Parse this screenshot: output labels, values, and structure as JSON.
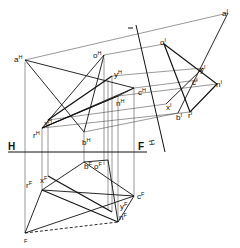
{
  "diagram": {
    "type": "descriptive-geometry-projection",
    "folding_lines": [
      {
        "name": "H-F",
        "labels": [
          "H",
          "F"
        ]
      },
      {
        "name": "H-I",
        "labels": [
          "H",
          "I"
        ]
      }
    ],
    "views": {
      "H": {
        "points": [
          "a",
          "o",
          "y",
          "c",
          "n",
          "x",
          "r",
          "b"
        ]
      },
      "F": {
        "points": [
          "b",
          "o",
          "x",
          "r",
          "c",
          "y",
          "n",
          "a"
        ]
      },
      "I": {
        "points": [
          "a",
          "o",
          "y",
          "c",
          "n",
          "x",
          "b",
          "r"
        ]
      }
    },
    "labels": {
      "aH": {
        "base": "a",
        "sup": "H"
      },
      "oH": {
        "base": "o",
        "sup": "H"
      },
      "yH": {
        "base": "y",
        "sup": "H"
      },
      "cH": {
        "base": "c",
        "sup": "H"
      },
      "nH": {
        "base": "n",
        "sup": "H"
      },
      "xH": {
        "base": "x",
        "sup": "H"
      },
      "rH": {
        "base": "r",
        "sup": "H"
      },
      "bH": {
        "base": "b",
        "sup": "H"
      },
      "bF": {
        "base": "b",
        "sup": "F"
      },
      "oF": {
        "base": "o",
        "sup": "F"
      },
      "xF": {
        "base": "x",
        "sup": "F"
      },
      "rF": {
        "base": "r",
        "sup": "F"
      },
      "cF": {
        "base": "c",
        "sup": "F"
      },
      "yF": {
        "base": "y",
        "sup": "F"
      },
      "nF": {
        "base": "n",
        "sup": "F"
      },
      "aF": {
        "base": "",
        "sup": "F"
      },
      "aI": {
        "base": "a",
        "sup": "I"
      },
      "oI": {
        "base": "o",
        "sup": "I"
      },
      "yI": {
        "base": "y",
        "sup": "I"
      },
      "cI": {
        "base": "c",
        "sup": "I"
      },
      "nI": {
        "base": "n",
        "sup": "I"
      },
      "xI": {
        "base": "x",
        "sup": "I"
      },
      "bI": {
        "base": "b",
        "sup": "I"
      },
      "rI": {
        "base": "r",
        "sup": "I"
      },
      "fold_H": "H",
      "fold_F": "F",
      "fold_I_top": "I",
      "fold_H_side": "H"
    }
  }
}
